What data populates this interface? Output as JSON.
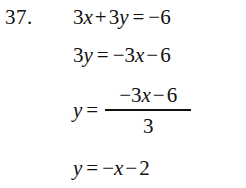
{
  "problem": {
    "number_label": "37.",
    "lines": [
      {
        "id": "line-1",
        "text": "3x + 3y = −6",
        "tokens": {
          "coef1": "3",
          "var1": "x",
          "plus": "+",
          "coef2": "3",
          "var2": "y",
          "equals": "=",
          "rhs": "−6"
        }
      },
      {
        "id": "line-2",
        "text": "3y = −3x − 6",
        "tokens": {
          "coef": "3",
          "var": "y",
          "equals": "=",
          "neg_coef": "−3",
          "var2": "x",
          "minus": "−",
          "constant": "6"
        }
      },
      {
        "id": "line-3",
        "text": "y = (−3x − 6) / 3",
        "tokens": {
          "var": "y",
          "equals": "=",
          "numerator_neg_coef": "−3",
          "numerator_var": "x",
          "numerator_minus": "−",
          "numerator_constant": "6",
          "denominator": "3"
        }
      },
      {
        "id": "line-4",
        "text": "y = −x − 2",
        "tokens": {
          "var": "y",
          "equals": "=",
          "neg": "−",
          "var2": "x",
          "minus": "−",
          "constant": "2"
        }
      }
    ]
  },
  "style": {
    "text_color": "#111111",
    "background_color": "#ffffff"
  }
}
